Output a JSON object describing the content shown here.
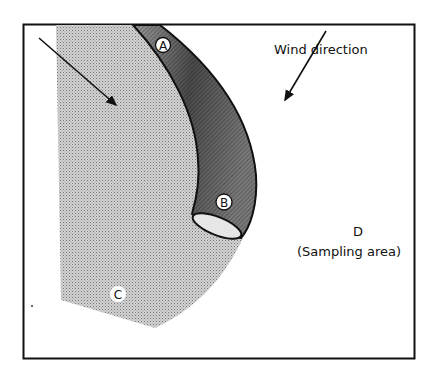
{
  "diagram": {
    "regions": {
      "A": {
        "label": "A"
      },
      "B": {
        "label": "B"
      },
      "C": {
        "label": "C"
      },
      "D": {
        "label": "D",
        "caption": "(Sampling area)"
      }
    },
    "wind": {
      "label": "Wind direction"
    },
    "arrows": [
      {
        "name": "flow-arrow",
        "from": [
          39,
          38
        ],
        "to": [
          118,
          107
        ]
      },
      {
        "name": "wind-direction-arrow",
        "from": [
          326,
          31
        ],
        "to": [
          283,
          103
        ]
      }
    ],
    "colors": {
      "frame": "#111111",
      "region_c": "#bdbdbd",
      "band_dark": "#555555",
      "band_mid": "#8a8a8a",
      "background": "#ffffff"
    }
  }
}
